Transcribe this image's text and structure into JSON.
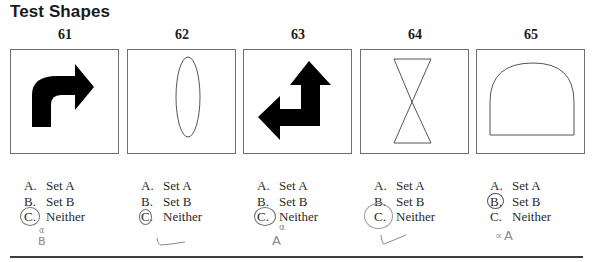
{
  "title": "Test Shapes",
  "items": [
    {
      "number": "61",
      "shape": "black curved right-turn arrow",
      "options": [
        {
          "letter": "A.",
          "label": "Set A"
        },
        {
          "letter": "B.",
          "label": "Set B"
        },
        {
          "letter": "C.",
          "label": "Neither"
        }
      ],
      "circled": "C",
      "annotation": {
        "mark": "B",
        "superscript": "α"
      }
    },
    {
      "number": "62",
      "shape": "outlined vertical ellipse",
      "options": [
        {
          "letter": "A.",
          "label": "Set A"
        },
        {
          "letter": "B.",
          "label": "Set B"
        },
        {
          "letter": "C.",
          "label": "Neither"
        }
      ],
      "circled": "C",
      "annotation": {
        "mark": "✓",
        "superscript": ""
      }
    },
    {
      "number": "63",
      "shape": "black double arrow (up and left)",
      "options": [
        {
          "letter": "A.",
          "label": "Set A"
        },
        {
          "letter": "B.",
          "label": "Set B"
        },
        {
          "letter": "C.",
          "label": "Neither"
        }
      ],
      "circled": "C",
      "annotation": {
        "mark": "A",
        "superscript": "α"
      }
    },
    {
      "number": "64",
      "shape": "outlined hourglass (two triangles)",
      "options": [
        {
          "letter": "A.",
          "label": "Set A"
        },
        {
          "letter": "B.",
          "label": "Set B"
        },
        {
          "letter": "C.",
          "label": "Neither"
        }
      ],
      "circled": "C",
      "annotation": {
        "mark": "✓",
        "superscript": ""
      }
    },
    {
      "number": "65",
      "shape": "outlined arch / rounded-top rectangle",
      "options": [
        {
          "letter": "A.",
          "label": "Set A"
        },
        {
          "letter": "B.",
          "label": "Set B"
        },
        {
          "letter": "C.",
          "label": "Neither"
        }
      ],
      "circled": "B",
      "annotation": {
        "mark": "A",
        "superscript": "∝"
      }
    }
  ]
}
